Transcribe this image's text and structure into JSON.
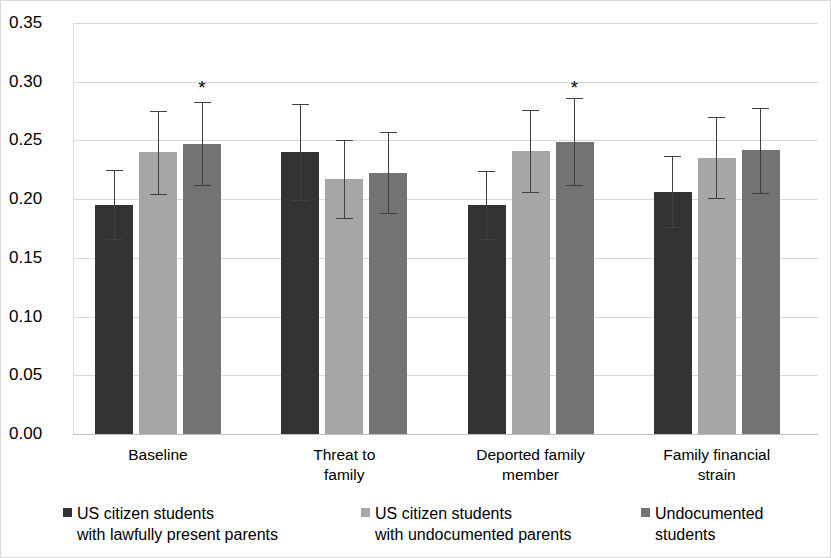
{
  "chart_data": {
    "type": "bar",
    "title": "",
    "subtitle": "",
    "xlabel": "",
    "ylabel": "",
    "ylim": [
      0.0,
      0.35
    ],
    "ytick_labels": [
      "0.35",
      "0.30",
      "0.25",
      "0.20",
      "0.15",
      "0.10",
      "0.05",
      "0.00"
    ],
    "ytick_values": [
      0.35,
      0.3,
      0.25,
      0.2,
      0.15,
      0.1,
      0.05,
      0.0
    ],
    "grid": true,
    "legend_position": "bottom",
    "categories": [
      "Baseline",
      "Threat to\nfamily",
      "Deported family\nmember",
      "Family financial\nstrain"
    ],
    "series": [
      {
        "name": "US citizen students\nwith lawfully present parents",
        "color": "#333333",
        "values": [
          0.195,
          0.24,
          0.195,
          0.206
        ],
        "err_low": [
          0.166,
          0.199,
          0.166,
          0.176
        ],
        "err_high": [
          0.225,
          0.281,
          0.224,
          0.237
        ],
        "significant": [
          false,
          false,
          false,
          false
        ]
      },
      {
        "name": "US citizen students\nwith undocumented parents",
        "color": "#a6a6a6",
        "values": [
          0.24,
          0.217,
          0.241,
          0.235
        ],
        "err_low": [
          0.204,
          0.184,
          0.206,
          0.201
        ],
        "err_high": [
          0.275,
          0.25,
          0.276,
          0.27
        ],
        "significant": [
          false,
          false,
          false,
          false
        ]
      },
      {
        "name": "Undocumented\nstudents",
        "color": "#737373",
        "values": [
          0.247,
          0.222,
          0.249,
          0.242
        ],
        "err_low": [
          0.212,
          0.188,
          0.212,
          0.205
        ],
        "err_high": [
          0.283,
          0.257,
          0.286,
          0.278
        ],
        "significant": [
          true,
          false,
          true,
          false
        ]
      }
    ],
    "annotations": [
      {
        "label": "*",
        "group": "Baseline",
        "series": "Undocumented\nstudents",
        "y": 0.303
      },
      {
        "label": "*",
        "group": "Deported family\nmember",
        "series": "Undocumented\nstudents",
        "y": 0.303
      }
    ]
  },
  "legend": {
    "items": [
      {
        "label": "US citizen students\nwith lawfully present parents",
        "color": "#333333"
      },
      {
        "label": "US citizen students\nwith undocumented parents",
        "color": "#a6a6a6"
      },
      {
        "label": "Undocumented\nstudents",
        "color": "#737373"
      }
    ]
  }
}
